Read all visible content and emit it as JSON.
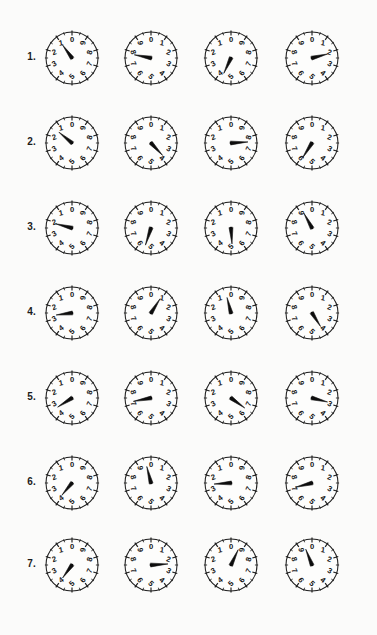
{
  "page": {
    "background_color": "#fbfbfa",
    "ink_color": "#141414",
    "columns": 4,
    "rows": 7
  },
  "dial": {
    "numerals": [
      "0",
      "1",
      "2",
      "3",
      "4",
      "5",
      "6",
      "7",
      "8",
      "9"
    ],
    "divisions": 10,
    "minor_ticks_per_division": 1,
    "radius": 26,
    "center_x": 31,
    "center_y": 31
  },
  "rows": [
    {
      "label": "1.",
      "clocks": [
        {
          "direction": "reversed",
          "hand_value": 1.0,
          "hand_length": 16
        },
        {
          "direction": "normal",
          "hand_value": 7.8,
          "hand_length": 17
        },
        {
          "direction": "reversed",
          "hand_value": 4.3,
          "hand_length": 17
        },
        {
          "direction": "normal",
          "hand_value": 2.1,
          "hand_length": 16
        }
      ]
    },
    {
      "label": "2.",
      "clocks": [
        {
          "direction": "reversed",
          "hand_value": 1.4,
          "hand_length": 17
        },
        {
          "direction": "normal",
          "hand_value": 3.8,
          "hand_length": 17
        },
        {
          "direction": "reversed",
          "hand_value": 7.6,
          "hand_length": 17
        },
        {
          "direction": "normal",
          "hand_value": 5.9,
          "hand_length": 18
        }
      ]
    },
    {
      "label": "3.",
      "clocks": [
        {
          "direction": "reversed",
          "hand_value": 2.1,
          "hand_length": 17
        },
        {
          "direction": "normal",
          "hand_value": 5.5,
          "hand_length": 18
        },
        {
          "direction": "reversed",
          "hand_value": 5.1,
          "hand_length": 16
        },
        {
          "direction": "normal",
          "hand_value": 9.2,
          "hand_length": 17
        }
      ]
    },
    {
      "label": "4.",
      "clocks": [
        {
          "direction": "reversed",
          "hand_value": 2.7,
          "hand_length": 16
        },
        {
          "direction": "normal",
          "hand_value": 0.9,
          "hand_length": 17
        },
        {
          "direction": "reversed",
          "hand_value": 0.4,
          "hand_length": 16
        },
        {
          "direction": "normal",
          "hand_value": 4.1,
          "hand_length": 16
        }
      ]
    },
    {
      "label": "5.",
      "clocks": [
        {
          "direction": "reversed",
          "hand_value": 3.4,
          "hand_length": 17
        },
        {
          "direction": "normal",
          "hand_value": 7.2,
          "hand_length": 18
        },
        {
          "direction": "reversed",
          "hand_value": 6.5,
          "hand_length": 17
        },
        {
          "direction": "normal",
          "hand_value": 2.9,
          "hand_length": 16
        }
      ]
    },
    {
      "label": "6.",
      "clocks": [
        {
          "direction": "reversed",
          "hand_value": 3.9,
          "hand_length": 16
        },
        {
          "direction": "normal",
          "hand_value": 9.6,
          "hand_length": 17
        },
        {
          "direction": "reversed",
          "hand_value": 2.6,
          "hand_length": 17
        },
        {
          "direction": "normal",
          "hand_value": 7.1,
          "hand_length": 17
        }
      ]
    },
    {
      "label": "7.",
      "clocks": [
        {
          "direction": "reversed",
          "hand_value": 4.0,
          "hand_length": 16
        },
        {
          "direction": "normal",
          "hand_value": 2.4,
          "hand_length": 17
        },
        {
          "direction": "reversed",
          "hand_value": 9.3,
          "hand_length": 17
        },
        {
          "direction": "normal",
          "hand_value": 9.4,
          "hand_length": 17
        }
      ]
    }
  ]
}
